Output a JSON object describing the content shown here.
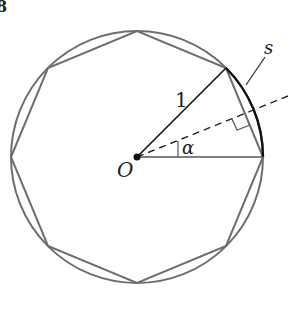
{
  "figure": {
    "corner_mark": "8",
    "labels": {
      "radius": "1",
      "arc": "s",
      "center": "O",
      "angle": "α"
    },
    "geometry": {
      "center": [
        137,
        157
      ],
      "radius": 126,
      "polygon_sides": 8
    },
    "colors": {
      "circle": "#6e6e6e",
      "polygon": "#6e6e6e",
      "highlight": "#111111",
      "background": "#ffffff"
    }
  }
}
